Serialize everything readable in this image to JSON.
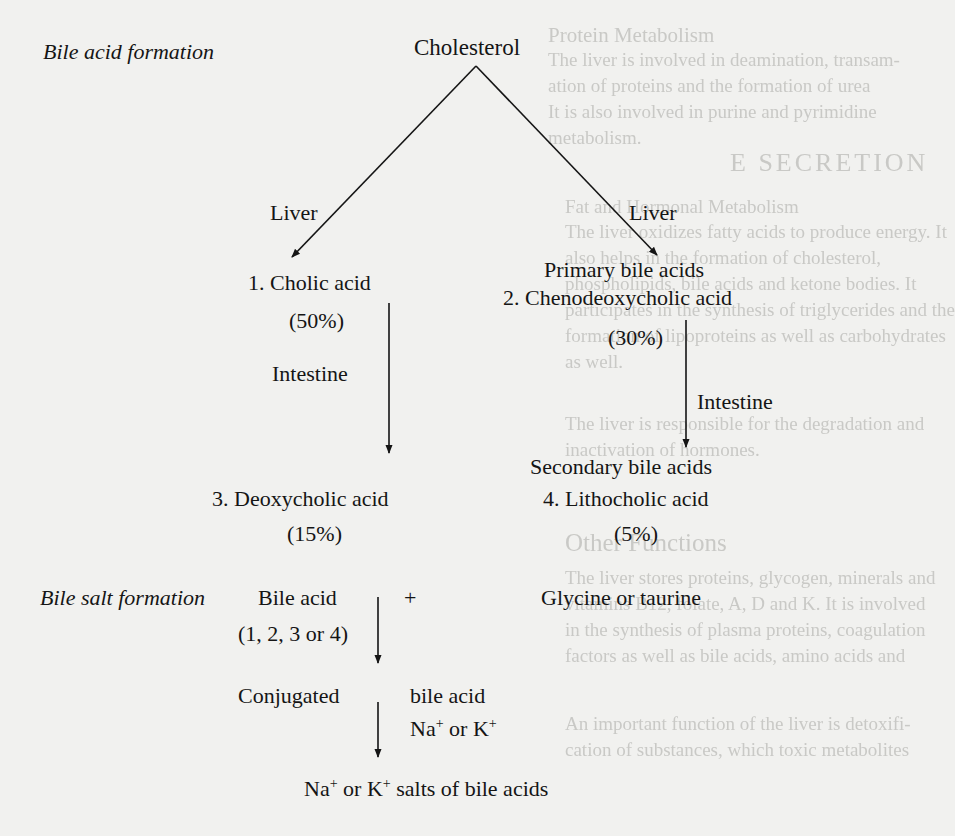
{
  "background_bleed_text": [
    "Protein Metabolism",
    "The liver is involved in deamination, transam-",
    "ation of proteins and the formation of urea",
    "It is also involved in purine and pyrimidine",
    "metabolism.",
    "Fat and Hormonal Metabolism",
    "The liver oxidizes fatty acids to produce energy. It",
    "also helps in the formation of cholesterol,",
    "phospholipids, bile acids and ketone bodies. It",
    "participates in the synthesis of triglycerides and the",
    "formation of lipoproteins as well as carbohydrates",
    "as well.",
    "The liver is responsible for the degradation and",
    "inactivation of hormones.",
    "Other Functions",
    "The liver stores proteins, glycogen, minerals and",
    "vitamins B12, folate, A, D and K. It is involved",
    "in the synthesis of plasma proteins, coagulation",
    "factors as well as bile acids, amino acids and",
    "An important function of the liver is detoxifi-",
    "cation of substances, which toxic metabolites",
    "E SECRETION"
  ],
  "section_a": {
    "title": "Bile acid formation",
    "root": "Cholesterol",
    "left_branch_label": "Liver",
    "right_branch_label": "Liver",
    "primary_group_label": "Primary bile acids",
    "primary": [
      {
        "name": "1. Cholic acid",
        "percent": "(50%)"
      },
      {
        "name": "2. Chenodeoxycholic acid",
        "percent": "(30%)"
      }
    ],
    "left_step_label": "Intestine",
    "right_step_label": "Intestine",
    "secondary_group_label": "Secondary bile acids",
    "secondary": [
      {
        "name": "3. Deoxycholic acid",
        "percent": "(15%)"
      },
      {
        "name": "4. Lithocholic acid",
        "percent": "(5%)"
      }
    ]
  },
  "section_b": {
    "title": "Bile salt formation",
    "reactant_1": "Bile acid",
    "reactant_1_note": "(1, 2, 3 or 4)",
    "plus": "+",
    "reactant_2": "Glycine or taurine",
    "intermediate_left": "Conjugated",
    "intermediate_right": "bile acid",
    "reagent_na": "Na",
    "reagent_or": " or K",
    "sup_plus": "+",
    "final_na": "Na",
    "final_or": " or K",
    "final_rest": " salts of bile acids"
  },
  "colors": {
    "ink": "#151515",
    "paper": "#f1f1ef",
    "bleed": "#c9c9c6"
  }
}
